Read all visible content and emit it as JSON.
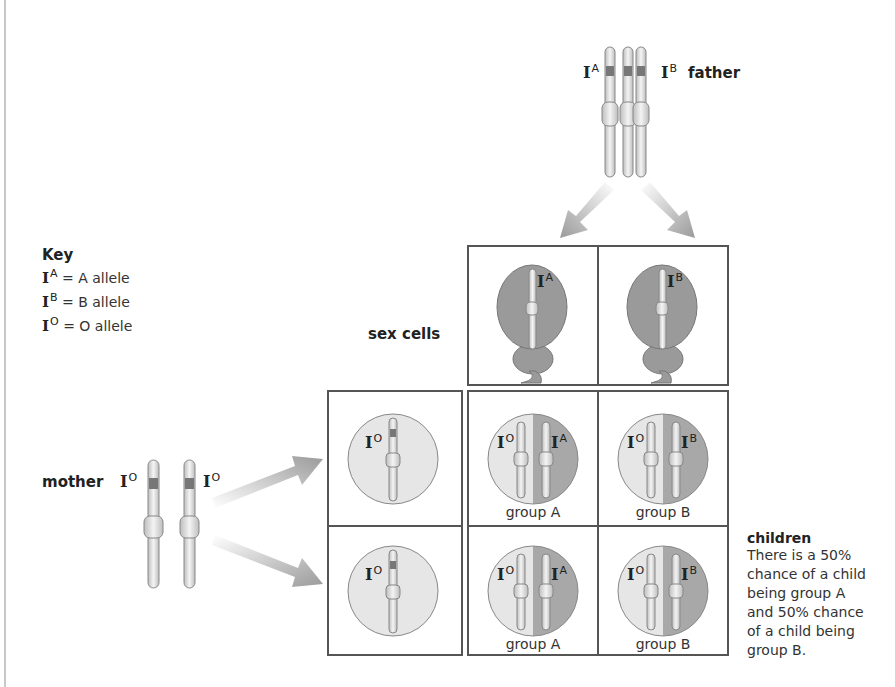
{
  "father": {
    "label": "father",
    "alleles": [
      {
        "base": "I",
        "sup": "A"
      },
      {
        "base": "I",
        "sup": "B"
      }
    ]
  },
  "mother": {
    "label": "mother",
    "alleles": [
      {
        "base": "I",
        "sup": "O"
      },
      {
        "base": "I",
        "sup": "O"
      }
    ]
  },
  "key": {
    "title": "Key",
    "items": [
      {
        "base": "I",
        "sup": "A",
        "text": "= A allele"
      },
      {
        "base": "I",
        "sup": "B",
        "text": "= B allele"
      },
      {
        "base": "I",
        "sup": "O",
        "text": "= O allele"
      }
    ]
  },
  "sex_cells": {
    "label": "sex cells",
    "sperm": [
      {
        "base": "I",
        "sup": "A"
      },
      {
        "base": "I",
        "sup": "B"
      }
    ],
    "eggs": [
      {
        "base": "I",
        "sup": "O"
      },
      {
        "base": "I",
        "sup": "O"
      }
    ]
  },
  "children_grid": {
    "rows": [
      {
        "cells": [
          {
            "left": {
              "base": "I",
              "sup": "O"
            },
            "right": {
              "base": "I",
              "sup": "A"
            },
            "group": "group A"
          },
          {
            "left": {
              "base": "I",
              "sup": "O"
            },
            "right": {
              "base": "I",
              "sup": "B"
            },
            "group": "group B"
          }
        ]
      },
      {
        "cells": [
          {
            "left": {
              "base": "I",
              "sup": "O"
            },
            "right": {
              "base": "I",
              "sup": "A"
            },
            "group": "group A"
          },
          {
            "left": {
              "base": "I",
              "sup": "O"
            },
            "right": {
              "base": "I",
              "sup": "B"
            },
            "group": "group B"
          }
        ]
      }
    ]
  },
  "children": {
    "title": "children",
    "lines": [
      "There is a 50%",
      "chance of a child",
      "being group A",
      "and 50% chance",
      "of a child being",
      "group B."
    ]
  },
  "colors": {
    "sperm_fill": "#9a9a9a",
    "egg_fill": "#e6e6e6",
    "dominant_half": "#a8a8a8",
    "box_border": "#555555",
    "arrow": "#9a9a9a"
  }
}
